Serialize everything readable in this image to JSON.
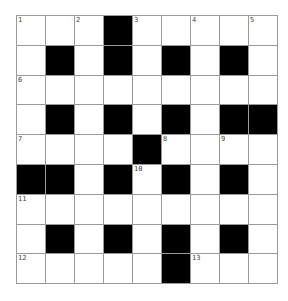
{
  "puzzle": {
    "rows": 9,
    "cols": 9,
    "layout": [
      "WWWBWWWWW",
      "WBWBWBWBW",
      "WWWWWWWWW",
      "WBWBWBWBB",
      "WWWWBWWWW",
      "BBWBWBWBW",
      "WWWWWWWWW",
      "WBWBWBWBW",
      "WWWWWBWWW"
    ],
    "numbers": [
      {
        "row": 0,
        "col": 0,
        "n": "1"
      },
      {
        "row": 0,
        "col": 2,
        "n": "2"
      },
      {
        "row": 0,
        "col": 4,
        "n": "3"
      },
      {
        "row": 0,
        "col": 6,
        "n": "4"
      },
      {
        "row": 0,
        "col": 8,
        "n": "5"
      },
      {
        "row": 2,
        "col": 0,
        "n": "6"
      },
      {
        "row": 4,
        "col": 0,
        "n": "7"
      },
      {
        "row": 4,
        "col": 5,
        "n": "8"
      },
      {
        "row": 4,
        "col": 7,
        "n": "9"
      },
      {
        "row": 5,
        "col": 4,
        "n": "10"
      },
      {
        "row": 6,
        "col": 0,
        "n": "11"
      },
      {
        "row": 8,
        "col": 0,
        "n": "12"
      },
      {
        "row": 8,
        "col": 6,
        "n": "13"
      }
    ],
    "colors": {
      "block": "#000000",
      "cell": "#ffffff",
      "line": "#9a9a9a"
    }
  }
}
